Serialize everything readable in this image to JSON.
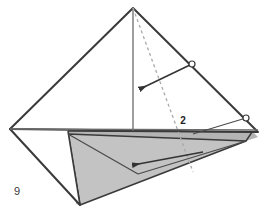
{
  "figure": {
    "step_number": "9",
    "fold_label": "2",
    "type": "origami-folding-diagram",
    "background_color": "#ffffff",
    "edge_color": "#3a3a3a",
    "thin_line_color": "#6b6b6b",
    "dashed_line_color": "#a9a9a9",
    "shaded_fill": "#c3c3c3",
    "shaded_fill_dark": "#b4b4b4",
    "marker_fill": "#ffffff",
    "arrow_color": "#333333"
  },
  "geometry": {
    "apex": [
      133,
      8
    ],
    "left_vertex": [
      10,
      129
    ],
    "right_vertex": [
      258,
      132
    ],
    "bottom_vertex": [
      80,
      205
    ],
    "baseline_left": [
      10,
      129
    ],
    "baseline_right": [
      258,
      129
    ],
    "shaded_top_left": [
      68,
      131
    ],
    "shaded_top_right": [
      252,
      131
    ],
    "shaded_bottom_right": [
      246,
      141
    ],
    "center_vertical_top": [
      133,
      8
    ],
    "center_vertical_bottom": [
      133,
      131
    ]
  },
  "markers": [
    {
      "name": "fold-point-upper",
      "cx": 192,
      "cy": 64,
      "r": 3
    },
    {
      "name": "fold-point-lower",
      "cx": 246,
      "cy": 118,
      "r": 3
    }
  ],
  "arrows": [
    {
      "name": "upper-fold-arrow",
      "from": [
        192,
        64
      ],
      "to": [
        138,
        90
      ],
      "direction": "down-left"
    },
    {
      "name": "lower-fold-arrow",
      "from": [
        203,
        152
      ],
      "to": [
        131,
        166
      ],
      "direction": "left"
    }
  ],
  "dashed_fold_line": {
    "name": "hidden-crease",
    "from": [
      133,
      8
    ],
    "to": [
      193,
      172
    ]
  }
}
